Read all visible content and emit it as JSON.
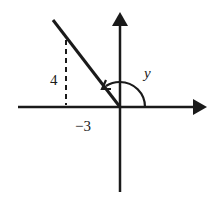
{
  "diagram": {
    "labels": {
      "vertical_leg": "4",
      "horizontal_leg": "−3",
      "angle": "y"
    },
    "point": {
      "x": -3,
      "y": 4
    },
    "colors": {
      "ink": "#1a1a1a",
      "background": "#ffffff"
    }
  }
}
